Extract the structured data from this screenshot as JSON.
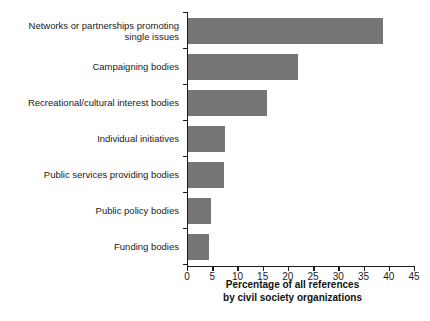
{
  "chart_data": {
    "type": "bar",
    "orientation": "horizontal",
    "title": "",
    "subtitle": "",
    "xlabel": "Percentage of all references\nby civil society organizations",
    "ylabel": "",
    "xlim": [
      0,
      45
    ],
    "ylim": null,
    "grid": false,
    "legend": null,
    "bar_color": "#767676",
    "axis_color": "#1a1a1a",
    "background_color": "#ffffff",
    "xticks": [
      0,
      5,
      10,
      15,
      20,
      25,
      30,
      35,
      40,
      45
    ],
    "xtick_labels": [
      "0",
      "5",
      "10",
      "15",
      "20",
      "25",
      "30",
      "35",
      "40",
      "45"
    ],
    "categories": [
      "Networks or partnerships promoting\nsingle issues",
      "Campaigning bodies",
      "Recreational/cultural interest bodies",
      "Individual initiatives",
      "Public services providing bodies",
      "Public policy bodies",
      "Funding bodies"
    ],
    "values": [
      38.6,
      21.8,
      15.6,
      7.4,
      7.2,
      4.6,
      4.2
    ],
    "annotations": []
  }
}
